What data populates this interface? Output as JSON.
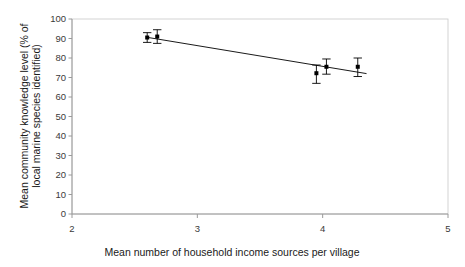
{
  "chart_data": {
    "type": "scatter",
    "title": "",
    "xlabel": "Mean number of household income sources per village",
    "ylabel": "Mean community knowledge level (% of local marine species identified)",
    "ylabel_line1": "Mean community knowledge level (% of",
    "ylabel_line2": "local marine species identified)",
    "xlim": [
      2,
      5
    ],
    "ylim": [
      0,
      100
    ],
    "xticks": [
      2,
      3,
      4,
      5
    ],
    "xtick_labels": [
      "2",
      "3",
      "4",
      "5"
    ],
    "yticks": [
      0,
      10,
      20,
      30,
      40,
      50,
      60,
      70,
      80,
      90,
      100
    ],
    "ytick_labels": [
      "0",
      "10",
      "20",
      "30",
      "40",
      "50",
      "60",
      "70",
      "80",
      "90",
      "100"
    ],
    "grid": false,
    "legend": "none",
    "marker": "filled-square",
    "marker_color": "#000000",
    "errorbar_color": "#000000",
    "plot_border_color": "#c8c8c8",
    "points": [
      {
        "x": 2.6,
        "y": 90.5,
        "yerr_low": 2.5,
        "yerr_high": 2.5
      },
      {
        "x": 2.68,
        "y": 91.0,
        "yerr_low": 3.5,
        "yerr_high": 3.5
      },
      {
        "x": 3.95,
        "y": 72.2,
        "yerr_low": 5.2,
        "yerr_high": 4.2
      },
      {
        "x": 4.03,
        "y": 75.5,
        "yerr_low": 3.8,
        "yerr_high": 4.0
      },
      {
        "x": 4.28,
        "y": 75.5,
        "yerr_low": 5.0,
        "yerr_high": 4.5
      }
    ],
    "trendline": {
      "x1": 2.6,
      "y1": 90.6,
      "x2": 4.35,
      "y2": 72.0,
      "color": "#000000"
    }
  }
}
